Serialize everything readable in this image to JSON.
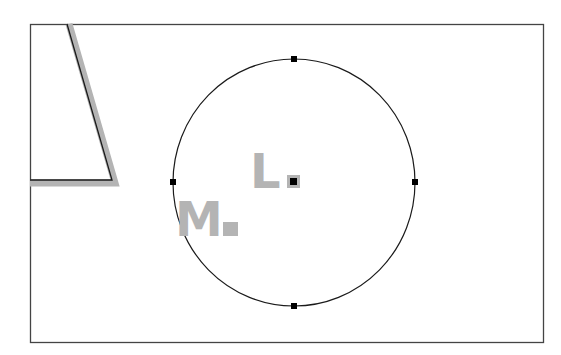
{
  "diagram": {
    "type": "geometric-sketch",
    "shapes": [
      {
        "id": "frame",
        "kind": "rectangle",
        "description": "outer bounding frame"
      },
      {
        "id": "wedge",
        "kind": "polyline",
        "description": "slanted line with horizontal base, highlighted (selected) with grey halo"
      },
      {
        "id": "circle",
        "kind": "circle",
        "description": "circle with four selection handles at top, right, bottom, left"
      }
    ],
    "handles": [
      "top",
      "right",
      "bottom",
      "left"
    ],
    "labels": [
      {
        "id": "L",
        "text": "L",
        "marker": "grey square with black center point"
      },
      {
        "id": "M",
        "text": "M",
        "marker": "grey square"
      }
    ],
    "colors": {
      "stroke": "#1a1a1a",
      "highlight": "#b4b4b4",
      "handle": "#000000",
      "background": "#ffffff"
    }
  }
}
